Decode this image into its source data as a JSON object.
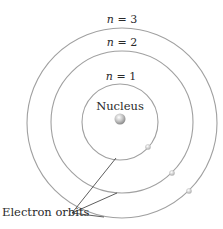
{
  "diagram": {
    "nucleus_label": "Nucleus",
    "pointer_label": "Electron orbits",
    "orbits": [
      {
        "n_var": "n",
        "eq": " = ",
        "n_value": "1",
        "label": "n = 1",
        "radius": 38
      },
      {
        "n_var": "n",
        "eq": " = ",
        "n_value": "2",
        "label": "n = 2",
        "radius": 71
      },
      {
        "n_var": "n",
        "eq": " = ",
        "n_value": "3",
        "label": "n = 3",
        "radius": 95
      }
    ],
    "electrons_per_orbit": 1,
    "colors": {
      "orbit_line": "#9a9a9a",
      "pointer_line": "#333333",
      "text": "#2a2a2a",
      "nucleus": "#b8b8b8",
      "electron": "#d0d0d0"
    }
  }
}
